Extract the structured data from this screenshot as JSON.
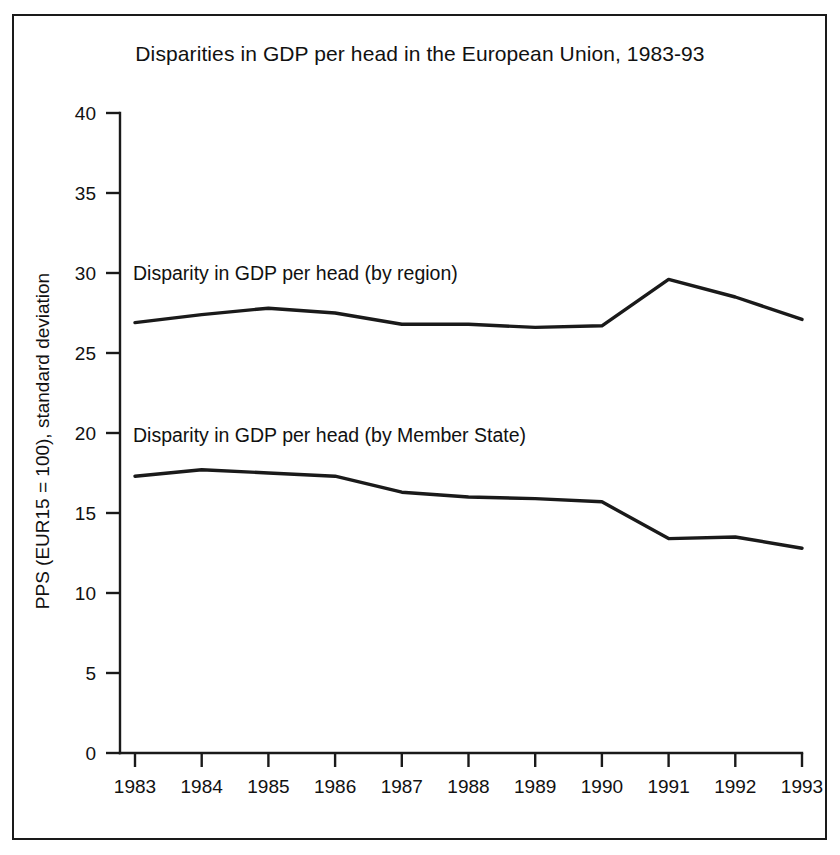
{
  "chart_data": {
    "type": "line",
    "title": "Disparities in GDP per head in the European Union, 1983-93",
    "xlabel": "",
    "ylabel": "PPS (EUR15 = 100), standard deviation",
    "categories": [
      "1983",
      "1984",
      "1985",
      "1986",
      "1987",
      "1988",
      "1989",
      "1990",
      "1991",
      "1992",
      "1993"
    ],
    "x": [
      1983,
      1984,
      1985,
      1986,
      1987,
      1988,
      1989,
      1990,
      1991,
      1992,
      1993
    ],
    "series": [
      {
        "name": "Disparity in GDP per head (by region)",
        "values": [
          26.9,
          27.4,
          27.8,
          27.5,
          26.8,
          26.8,
          26.6,
          26.7,
          29.6,
          28.5,
          27.1
        ]
      },
      {
        "name": "Disparity in GDP per head (by Member State)",
        "values": [
          17.3,
          17.7,
          17.5,
          17.3,
          16.3,
          16.0,
          15.9,
          15.7,
          13.4,
          13.5,
          12.8
        ]
      }
    ],
    "ylim": [
      0,
      40
    ],
    "yticks": [
      0,
      5,
      10,
      15,
      20,
      25,
      30,
      35,
      40
    ],
    "ytick_labels": [
      "0",
      "5",
      "10",
      "15",
      "20",
      "25",
      "30",
      "35",
      "40"
    ],
    "grid": false,
    "legend": "inline-annotations",
    "line_color": "#1a1a1a"
  },
  "annotations": {
    "region_label": "Disparity in GDP per head (by region)",
    "member_state_label": "Disparity in GDP per head (by Member State)"
  }
}
